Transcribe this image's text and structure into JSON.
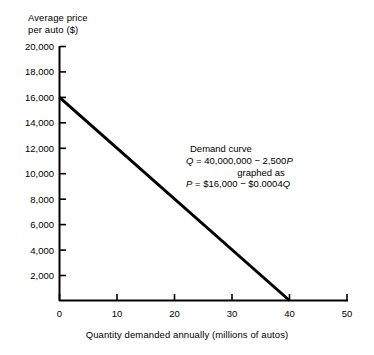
{
  "chart_data": {
    "type": "line",
    "title": "",
    "ylabel_lines": [
      "Average price",
      "per auto ($)"
    ],
    "xlabel": "Quantity demanded annually (millions of autos)",
    "xlim": [
      0,
      50
    ],
    "ylim": [
      0,
      20000
    ],
    "grid": false,
    "legend_position": "none",
    "x_ticks": [
      0,
      10,
      20,
      30,
      40,
      50
    ],
    "x_tick_labels": [
      "0",
      "10",
      "20",
      "30",
      "40",
      "50"
    ],
    "y_ticks": [
      2000,
      4000,
      6000,
      8000,
      10000,
      12000,
      14000,
      16000,
      18000,
      20000
    ],
    "y_tick_labels": [
      "2,000",
      "4,000",
      "6,000",
      "8,000",
      "10,000",
      "12,000",
      "14,000",
      "16,000",
      "18,000",
      "20,000"
    ],
    "series": [
      {
        "name": "Demand curve",
        "x": [
          0,
          40
        ],
        "y": [
          16000,
          0
        ],
        "color": "#000000",
        "line_width": 3
      }
    ],
    "annotations": [
      {
        "name": "demand-curve-equation",
        "lines": [
          "Demand curve",
          "Q = 40,000,000 − 2,500P",
          "graphed as",
          "P = $16,000 − $0.0004Q"
        ]
      }
    ]
  },
  "annotation": {
    "title": "Demand curve",
    "eq1_var_q": "Q",
    "eq1_rest": " = 40,000,000 − 2,500",
    "eq1_var_p": "P",
    "connector": "graphed as",
    "eq2_var_p": "P",
    "eq2_rest": " = $16,000 − $0.0004",
    "eq2_var_q": "Q"
  },
  "axes": {
    "y_title_line1": "Average price",
    "y_title_line2": "per auto ($)",
    "x_title": "Quantity demanded annually (millions of autos)"
  },
  "colors": {
    "axis": "#000000",
    "curve": "#000000",
    "background": "#ffffff"
  }
}
